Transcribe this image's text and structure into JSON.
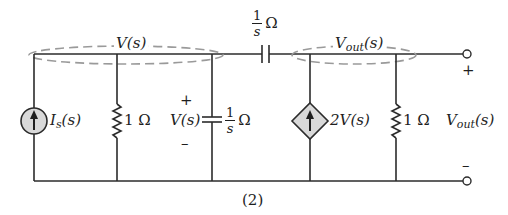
{
  "figure": {
    "caption": "(2)",
    "colors": {
      "wire": "#2b2b2b",
      "source_fill": "#d9d9d9",
      "node_highlight": "#9a9a9a",
      "text": "#1e1e1e"
    }
  },
  "nodes": {
    "left_node": {
      "label": "V(s)"
    },
    "right_node": {
      "label": "V",
      "label_sub": "out",
      "label_tail": "(s)"
    }
  },
  "components": {
    "current_source": {
      "type": "independent current source",
      "label": "I",
      "label_sub": "s",
      "label_tail": "(s)",
      "direction": "up"
    },
    "resistor_left": {
      "type": "resistor",
      "label": "1 Ω"
    },
    "shunt_capacitor": {
      "type": "capacitor",
      "impedance_num": "1",
      "impedance_den": "s",
      "unit": "Ω",
      "voltage_label": "V(s)",
      "plus": "+",
      "minus": "–"
    },
    "series_capacitor": {
      "type": "capacitor",
      "impedance_num": "1",
      "impedance_den": "s",
      "unit": "Ω"
    },
    "dependent_source": {
      "type": "dependent current source",
      "label": "2V(s)",
      "direction": "up"
    },
    "resistor_right": {
      "type": "resistor",
      "label": "1 Ω"
    }
  },
  "output": {
    "label": "V",
    "label_sub": "out",
    "label_tail": "(s)",
    "plus": "+",
    "minus": "–"
  }
}
